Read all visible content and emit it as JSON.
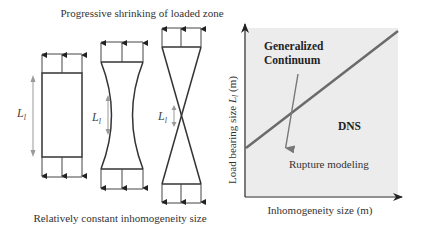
{
  "left_panel": {
    "title": "Progressive shrinking of loaded zone",
    "caption": "Relatively constant inhomogeneity size",
    "specimens": [
      {
        "name": "rectangle",
        "length_label": "L",
        "length_sub": "l"
      },
      {
        "name": "necked",
        "length_label": "L",
        "length_sub": "l"
      },
      {
        "name": "hourglass",
        "length_label": "L",
        "length_sub": "l"
      }
    ]
  },
  "right_panel": {
    "xlabel": "Inhomogeneity size (m)",
    "ylabel_prefix": "Load bearing size ",
    "ylabel_var": "L",
    "ylabel_sub": "l",
    "ylabel_suffix": " (m)",
    "region_upper": [
      "Generalized",
      "Continuum"
    ],
    "region_lower": "DNS",
    "arrow_label": "Rupture modeling",
    "colors": {
      "background": "#ececec",
      "boundary_line": "#6b6b6b",
      "arrow": "#777777",
      "axis": "#222222"
    }
  }
}
